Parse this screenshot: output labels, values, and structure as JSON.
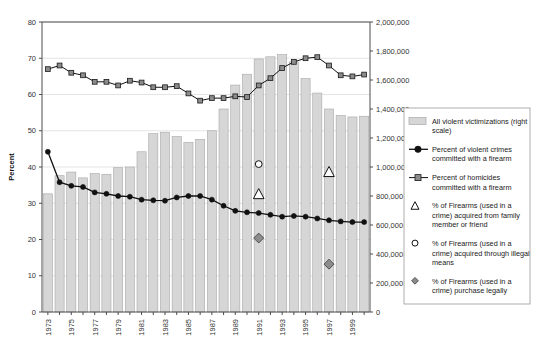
{
  "chart_data": {
    "type": "bar",
    "title": "",
    "xlabel": "",
    "ylabel": "Percent",
    "y2label": "",
    "ylim": [
      0,
      80
    ],
    "y2lim": [
      0,
      2000000
    ],
    "grid": true,
    "legend_position": "right",
    "x": [
      1973,
      1974,
      1975,
      1976,
      1977,
      1978,
      1979,
      1980,
      1981,
      1982,
      1983,
      1984,
      1985,
      1986,
      1987,
      1988,
      1989,
      1990,
      1991,
      1992,
      1993,
      1994,
      1995,
      1996,
      1997,
      1998,
      1999,
      2000
    ],
    "xtick_labels": [
      "1973",
      "1975",
      "1977",
      "1979",
      "1981",
      "1983",
      "1985",
      "1987",
      "1989",
      "1991",
      "1993",
      "1995",
      "1997",
      "1999"
    ],
    "ytick_labels": [
      "0",
      "10",
      "20",
      "30",
      "40",
      "50",
      "60",
      "70",
      "80"
    ],
    "y2tick_labels": [
      "0",
      "200,000",
      "400,000",
      "600,000",
      "800,000",
      "1,000,000",
      "1,200,000",
      "1,400,000",
      "1,600,000",
      "1,800,000",
      "2,000,000"
    ],
    "series": [
      {
        "name": "All violent victimizations (right scale)",
        "type": "bar",
        "axis": "right",
        "color": "#d6d6d6",
        "values": [
          815000,
          940000,
          965000,
          925000,
          955000,
          950000,
          995000,
          1000000,
          1105000,
          1230000,
          1240000,
          1210000,
          1170000,
          1190000,
          1250000,
          1400000,
          1565000,
          1640000,
          1745000,
          1760000,
          1775000,
          1725000,
          1610000,
          1510000,
          1400000,
          1355000,
          1345000,
          1350000
        ]
      },
      {
        "name": "Percent of violent crimes committed with a firearm",
        "type": "line",
        "axis": "left",
        "marker": "filled-circle",
        "color": "#111111",
        "values": [
          44.2,
          35.8,
          34.8,
          34.5,
          33.0,
          32.6,
          32.0,
          31.8,
          31.0,
          30.8,
          30.7,
          31.6,
          32.0,
          32.0,
          31.0,
          29.3,
          27.9,
          27.5,
          27.3,
          26.8,
          26.3,
          26.5,
          26.3,
          25.8,
          25.3,
          25.0,
          24.8,
          24.8
        ]
      },
      {
        "name": "Percent of homicides committed with a firearm",
        "type": "line",
        "axis": "left",
        "marker": "filled-square",
        "color": "#8c8c8c",
        "values": [
          67.0,
          68.0,
          66.0,
          65.3,
          63.5,
          63.5,
          62.5,
          63.8,
          63.3,
          62.0,
          62.0,
          62.3,
          60.3,
          58.3,
          59.0,
          59.0,
          59.5,
          59.3,
          62.5,
          64.5,
          67.3,
          69.0,
          70.0,
          70.3,
          68.0,
          65.3,
          65.0,
          65.5
        ]
      },
      {
        "name": "% of Firearms (used in a crime) acquired from family member or friend",
        "type": "scatter",
        "axis": "left",
        "marker": "open-triangle",
        "color": "#ffffff",
        "points": [
          {
            "x": 1991,
            "y": 32.5
          },
          {
            "x": 1997,
            "y": 38.6
          }
        ]
      },
      {
        "name": "% of Firearms (used in a crime) acquired through illegal means",
        "type": "scatter",
        "axis": "left",
        "marker": "open-circle",
        "color": "#ffffff",
        "points": [
          {
            "x": 1991,
            "y": 40.8
          }
        ]
      },
      {
        "name": "% of Firearms (used in a crime) purchase legally",
        "type": "scatter",
        "axis": "left",
        "marker": "filled-diamond",
        "color": "#8c8c8c",
        "points": [
          {
            "x": 1991,
            "y": 20.4
          },
          {
            "x": 1997,
            "y": 13.2
          }
        ]
      }
    ]
  },
  "axes": {
    "left_title": "Percent",
    "ytick_labels": [
      "80",
      "70",
      "60",
      "50",
      "40",
      "30",
      "20",
      "10",
      "0"
    ],
    "y2tick_labels": [
      "2,000,000",
      "1,800,000",
      "1,600,000",
      "1,400,000",
      "1,200,000",
      "1,000,000",
      "800,000",
      "600,000",
      "400,000",
      "200,000",
      "0"
    ],
    "xtick_labels": [
      "1973",
      "1975",
      "1977",
      "1979",
      "1981",
      "1983",
      "1985",
      "1987",
      "1989",
      "1991",
      "1993",
      "1995",
      "1997",
      "1999"
    ]
  },
  "legend": {
    "items": [
      {
        "marker": "bar-swatch",
        "lines": [
          "All violent victimizations (right",
          "scale)"
        ]
      },
      {
        "marker": "line-circle",
        "lines": [
          "Percent of violent crimes",
          "committed with a firearm"
        ]
      },
      {
        "marker": "line-square",
        "lines": [
          "Percent of homicides",
          "committed with a firearm"
        ]
      },
      {
        "marker": "open-triangle",
        "lines": [
          "% of Firearms (used in a",
          "crime) acquired from family",
          "member or friend"
        ]
      },
      {
        "marker": "open-circle",
        "lines": [
          "% of Firearms (used in a",
          "crime) acquired through illegal",
          "means"
        ]
      },
      {
        "marker": "filled-diamond",
        "lines": [
          "% of Firearms (used in a",
          "crime) purchase legally"
        ]
      }
    ]
  }
}
